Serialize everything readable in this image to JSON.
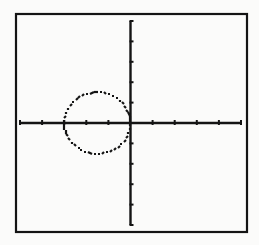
{
  "colors": {
    "background": "#fbfbfa",
    "ink": "#141414"
  },
  "chart_data": {
    "type": "line",
    "title": "",
    "xlabel": "",
    "ylabel": "",
    "xlim": [
      -5,
      5
    ],
    "ylim": [
      -5,
      5
    ],
    "xscl": 1,
    "yscl": 1,
    "grid": false,
    "legend": null,
    "series": [
      {
        "name": "circle",
        "equation": "(x+1.5)^2 + y^2 = 2.25",
        "center": [
          -1.5,
          0
        ],
        "radius": 1.5,
        "style": "pixelated-dashed"
      }
    ],
    "x_ticks": [
      -5,
      -4,
      -3,
      -2,
      -1,
      1,
      2,
      3,
      4,
      5
    ],
    "y_ticks": [
      -5,
      -4,
      -3,
      -2,
      -1,
      1,
      2,
      3,
      4,
      5
    ]
  },
  "frame": {
    "left": 16,
    "top": 14,
    "right": 247,
    "bottom": 232
  },
  "plot_area": {
    "x_min_px": 20,
    "x_max_px": 241,
    "y_min_px": 225,
    "y_max_px": 21
  }
}
